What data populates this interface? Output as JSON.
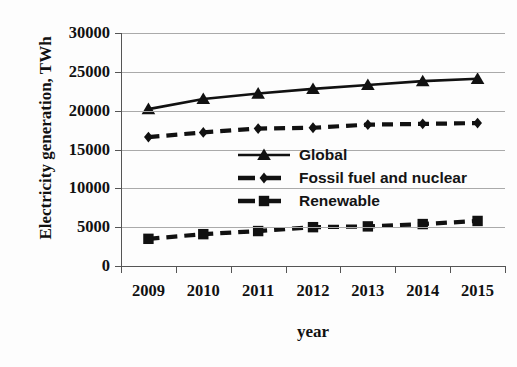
{
  "chart_data": {
    "type": "line",
    "title": "",
    "xlabel": "year",
    "ylabel": "Electricity generation, TWh",
    "categories": [
      "2009",
      "2010",
      "2011",
      "2012",
      "2013",
      "2014",
      "2015"
    ],
    "ylim": [
      0,
      30000
    ],
    "yticks": [
      "0",
      "5000",
      "10000",
      "15000",
      "20000",
      "25000",
      "30000"
    ],
    "ytick_values": [
      0,
      5000,
      10000,
      15000,
      20000,
      25000,
      30000
    ],
    "grid": "horizontal",
    "legend_position": "center",
    "series": [
      {
        "name": "Global",
        "marker": "triangle",
        "linestyle": "solid",
        "color": "#111111",
        "values": [
          20200,
          21500,
          22200,
          22800,
          23300,
          23800,
          24100
        ]
      },
      {
        "name": "Fossil fuel and nuclear",
        "marker": "diamond",
        "linestyle": "dashed",
        "color": "#111111",
        "values": [
          16600,
          17200,
          17700,
          17800,
          18200,
          18300,
          18400
        ]
      },
      {
        "name": "Renewable",
        "marker": "square",
        "linestyle": "dashed",
        "color": "#111111",
        "values": [
          3500,
          4100,
          4500,
          5000,
          5100,
          5400,
          5800
        ]
      }
    ]
  }
}
